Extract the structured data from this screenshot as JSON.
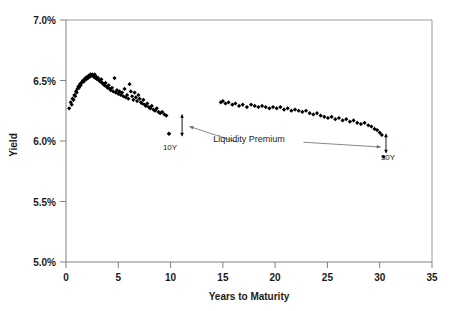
{
  "chart_data": {
    "type": "scatter",
    "title": "",
    "xlabel": "Years to Maturity",
    "ylabel": "Yield",
    "xlim": [
      0,
      35
    ],
    "ylim": [
      5.0,
      7.0
    ],
    "xticks": [
      0,
      5,
      10,
      15,
      20,
      25,
      30,
      35
    ],
    "xtick_labels": [
      "0",
      "5",
      "10",
      "15",
      "20",
      "25",
      "30",
      "35"
    ],
    "yticks": [
      5.0,
      5.5,
      6.0,
      6.5,
      7.0
    ],
    "ytick_labels": [
      "5.0%",
      "5.5%",
      "6.0%",
      "6.5%",
      "7.0%"
    ],
    "grid": false,
    "legend": false,
    "marker": "diamond",
    "marker_color": "#000000",
    "series": [
      {
        "name": "Off-the-run Treasury yields",
        "points": [
          [
            0.3,
            6.27
          ],
          [
            0.45,
            6.32
          ],
          [
            0.55,
            6.3
          ],
          [
            0.62,
            6.35
          ],
          [
            0.72,
            6.34
          ],
          [
            0.8,
            6.38
          ],
          [
            0.88,
            6.37
          ],
          [
            0.95,
            6.41
          ],
          [
            1.02,
            6.4
          ],
          [
            1.1,
            6.43
          ],
          [
            1.18,
            6.45
          ],
          [
            1.25,
            6.44
          ],
          [
            1.33,
            6.47
          ],
          [
            1.4,
            6.46
          ],
          [
            1.48,
            6.48
          ],
          [
            1.55,
            6.49
          ],
          [
            1.63,
            6.5
          ],
          [
            1.7,
            6.49
          ],
          [
            1.78,
            6.51
          ],
          [
            1.86,
            6.52
          ],
          [
            1.94,
            6.51
          ],
          [
            2.02,
            6.53
          ],
          [
            2.1,
            6.52
          ],
          [
            2.18,
            6.54
          ],
          [
            2.26,
            6.53
          ],
          [
            2.34,
            6.55
          ],
          [
            2.42,
            6.54
          ],
          [
            2.5,
            6.55
          ],
          [
            2.58,
            6.54
          ],
          [
            2.66,
            6.53
          ],
          [
            2.74,
            6.55
          ],
          [
            2.82,
            6.52
          ],
          [
            2.9,
            6.53
          ],
          [
            2.98,
            6.51
          ],
          [
            3.08,
            6.52
          ],
          [
            3.18,
            6.5
          ],
          [
            3.28,
            6.49
          ],
          [
            3.38,
            6.51
          ],
          [
            3.48,
            6.48
          ],
          [
            3.58,
            6.47
          ],
          [
            3.68,
            6.46
          ],
          [
            3.78,
            6.48
          ],
          [
            3.88,
            6.45
          ],
          [
            3.98,
            6.44
          ],
          [
            4.08,
            6.46
          ],
          [
            4.18,
            6.43
          ],
          [
            4.28,
            6.42
          ],
          [
            4.4,
            6.44
          ],
          [
            4.52,
            6.41
          ],
          [
            4.64,
            6.52
          ],
          [
            4.76,
            6.4
          ],
          [
            4.88,
            6.42
          ],
          [
            5.0,
            6.39
          ],
          [
            5.12,
            6.41
          ],
          [
            5.24,
            6.38
          ],
          [
            5.36,
            6.4
          ],
          [
            5.48,
            6.37
          ],
          [
            5.6,
            6.43
          ],
          [
            5.72,
            6.36
          ],
          [
            5.84,
            6.38
          ],
          [
            5.96,
            6.35
          ],
          [
            6.08,
            6.47
          ],
          [
            6.2,
            6.41
          ],
          [
            6.32,
            6.37
          ],
          [
            6.44,
            6.34
          ],
          [
            6.56,
            6.4
          ],
          [
            6.68,
            6.36
          ],
          [
            6.8,
            6.33
          ],
          [
            6.92,
            6.38
          ],
          [
            7.04,
            6.35
          ],
          [
            7.16,
            6.32
          ],
          [
            7.28,
            6.31
          ],
          [
            7.4,
            6.34
          ],
          [
            7.52,
            6.3
          ],
          [
            7.64,
            6.29
          ],
          [
            7.78,
            6.31
          ],
          [
            7.92,
            6.28
          ],
          [
            8.06,
            6.27
          ],
          [
            8.2,
            6.29
          ],
          [
            8.36,
            6.26
          ],
          [
            8.52,
            6.25
          ],
          [
            8.68,
            6.27
          ],
          [
            8.84,
            6.24
          ],
          [
            9.0,
            6.23
          ],
          [
            9.2,
            6.24
          ],
          [
            9.4,
            6.22
          ],
          [
            9.6,
            6.21
          ],
          [
            9.85,
            6.06
          ]
        ]
      },
      {
        "name": "Long-end Treasury yields",
        "points": [
          [
            14.8,
            6.32
          ],
          [
            15.0,
            6.33
          ],
          [
            15.25,
            6.31
          ],
          [
            15.55,
            6.32
          ],
          [
            15.9,
            6.3
          ],
          [
            16.2,
            6.31
          ],
          [
            16.55,
            6.29
          ],
          [
            16.9,
            6.3
          ],
          [
            17.3,
            6.28
          ],
          [
            17.7,
            6.3
          ],
          [
            18.05,
            6.29
          ],
          [
            18.4,
            6.28
          ],
          [
            18.75,
            6.29
          ],
          [
            19.1,
            6.28
          ],
          [
            19.45,
            6.27
          ],
          [
            19.8,
            6.28
          ],
          [
            20.15,
            6.27
          ],
          [
            20.5,
            6.28
          ],
          [
            20.85,
            6.26
          ],
          [
            21.2,
            6.27
          ],
          [
            21.55,
            6.25
          ],
          [
            21.9,
            6.26
          ],
          [
            22.25,
            6.25
          ],
          [
            22.6,
            6.24
          ],
          [
            22.95,
            6.25
          ],
          [
            23.3,
            6.23
          ],
          [
            23.65,
            6.22
          ],
          [
            24.0,
            6.23
          ],
          [
            24.35,
            6.21
          ],
          [
            24.7,
            6.2
          ],
          [
            25.05,
            6.19
          ],
          [
            25.4,
            6.2
          ],
          [
            25.75,
            6.18
          ],
          [
            26.1,
            6.19
          ],
          [
            26.45,
            6.17
          ],
          [
            26.8,
            6.18
          ],
          [
            27.15,
            6.16
          ],
          [
            27.5,
            6.17
          ],
          [
            27.85,
            6.15
          ],
          [
            28.2,
            6.14
          ],
          [
            28.55,
            6.15
          ],
          [
            28.9,
            6.13
          ],
          [
            29.2,
            6.12
          ],
          [
            29.5,
            6.1
          ],
          [
            29.75,
            6.09
          ],
          [
            30.0,
            6.07
          ],
          [
            30.2,
            6.05
          ]
        ]
      },
      {
        "name": "On-the-run benchmarks",
        "points": [
          [
            9.85,
            6.06
          ],
          [
            30.35,
            5.87
          ]
        ]
      }
    ],
    "annotations": [
      {
        "text": "Liquidity Premium",
        "x": 17.5,
        "y": 5.97
      },
      {
        "text": "10Y",
        "x": 10.0,
        "y": 5.94
      },
      {
        "text": "30Y",
        "x": 30.5,
        "y": 5.78
      }
    ],
    "arrows": [
      {
        "name": "liquidity-premium-arrow-10y",
        "x": 11.1,
        "y_top": 6.22,
        "y_bottom": 6.04
      },
      {
        "name": "liquidity-premium-arrow-30y",
        "x": 30.6,
        "y_top": 6.06,
        "y_bottom": 5.9
      }
    ],
    "leader_lines": [
      {
        "name": "leader-to-10y",
        "x1": 16.4,
        "y1": 5.99,
        "x2": 11.8,
        "y2": 6.12
      },
      {
        "name": "leader-to-30y",
        "x1": 22.7,
        "y1": 5.99,
        "x2": 30.1,
        "y2": 5.95
      }
    ]
  }
}
